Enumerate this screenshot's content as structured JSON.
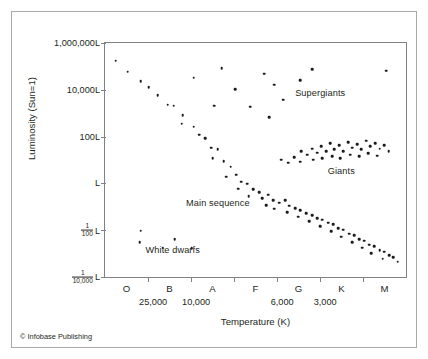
{
  "figure": {
    "credit": "© Infobase Publishing"
  },
  "chart_data": {
    "type": "scatter",
    "title": "",
    "xlabel": "Temperature (K)",
    "ylabel": "Luminosity (Sun=1)",
    "grid": false,
    "legend": "none",
    "x_axis": {
      "label": "Temperature (K)",
      "spectral_classes": [
        "O",
        "B",
        "A",
        "F",
        "G",
        "K",
        "M"
      ],
      "temperature_ticks": [
        {
          "label": "25,000",
          "class": "B"
        },
        {
          "label": "10,000",
          "class": "A"
        },
        {
          "label": "6,000",
          "class": "G"
        },
        {
          "label": "3,000",
          "class": "K"
        }
      ],
      "direction": "decreasing temperature to the right"
    },
    "y_axis": {
      "label": "Luminosity (Sun=1)",
      "scale": "log",
      "ticks": [
        {
          "label": "1,000,000L",
          "value": 1000000
        },
        {
          "label": "10,000L",
          "value": 10000
        },
        {
          "label": "100L",
          "value": 100
        },
        {
          "label": "L",
          "value": 1
        },
        {
          "label": "1/100 L",
          "numerator": "1",
          "denominator": "100",
          "unit": "L",
          "value": 0.01
        },
        {
          "label": "1/10,000 L",
          "numerator": "1",
          "denominator": "10,000",
          "unit": "L",
          "value": 0.0001
        }
      ],
      "ylim": [
        0.0001,
        1000000
      ]
    },
    "annotations": [
      {
        "text": "Supergiants",
        "x": 0.715,
        "y": 0.215
      },
      {
        "text": "Giants",
        "x": 0.785,
        "y": 0.545
      },
      {
        "text": "Main sequence",
        "x": 0.375,
        "y": 0.685
      },
      {
        "text": "White dwarfs",
        "x": 0.225,
        "y": 0.885
      }
    ],
    "series": [
      {
        "name": "Main sequence",
        "points": [
          [
            0.035,
            0.075
          ],
          [
            0.075,
            0.122
          ],
          [
            0.118,
            0.162
          ],
          [
            0.145,
            0.188
          ],
          [
            0.175,
            0.223
          ],
          [
            0.208,
            0.263
          ],
          [
            0.228,
            0.268
          ],
          [
            0.258,
            0.308
          ],
          [
            0.255,
            0.345
          ],
          [
            0.295,
            0.358
          ],
          [
            0.312,
            0.392
          ],
          [
            0.332,
            0.408
          ],
          [
            0.352,
            0.448
          ],
          [
            0.375,
            0.455
          ],
          [
            0.358,
            0.492
          ],
          [
            0.395,
            0.505
          ],
          [
            0.418,
            0.528
          ],
          [
            0.435,
            0.562
          ],
          [
            0.402,
            0.572
          ],
          [
            0.452,
            0.592
          ],
          [
            0.472,
            0.602
          ],
          [
            0.442,
            0.622
          ],
          [
            0.492,
            0.625
          ],
          [
            0.512,
            0.638
          ],
          [
            0.478,
            0.655
          ],
          [
            0.522,
            0.662
          ],
          [
            0.542,
            0.648
          ],
          [
            0.558,
            0.672
          ],
          [
            0.535,
            0.692
          ],
          [
            0.578,
            0.682
          ],
          [
            0.598,
            0.672
          ],
          [
            0.562,
            0.708
          ],
          [
            0.612,
            0.695
          ],
          [
            0.632,
            0.705
          ],
          [
            0.605,
            0.722
          ],
          [
            0.648,
            0.715
          ],
          [
            0.668,
            0.728
          ],
          [
            0.642,
            0.742
          ],
          [
            0.688,
            0.735
          ],
          [
            0.705,
            0.748
          ],
          [
            0.678,
            0.762
          ],
          [
            0.722,
            0.755
          ],
          [
            0.742,
            0.768
          ],
          [
            0.715,
            0.782
          ],
          [
            0.758,
            0.775
          ],
          [
            0.775,
            0.792
          ],
          [
            0.752,
            0.805
          ],
          [
            0.792,
            0.798
          ],
          [
            0.812,
            0.815
          ],
          [
            0.785,
            0.828
          ],
          [
            0.828,
            0.822
          ],
          [
            0.845,
            0.838
          ],
          [
            0.822,
            0.852
          ],
          [
            0.862,
            0.845
          ],
          [
            0.878,
            0.862
          ],
          [
            0.855,
            0.875
          ],
          [
            0.895,
            0.868
          ],
          [
            0.912,
            0.885
          ],
          [
            0.885,
            0.898
          ],
          [
            0.928,
            0.892
          ],
          [
            0.945,
            0.908
          ],
          [
            0.922,
            0.922
          ],
          [
            0.958,
            0.915
          ],
          [
            0.972,
            0.935
          ]
        ]
      },
      {
        "name": "Giants",
        "points": [
          [
            0.628,
            0.488
          ],
          [
            0.652,
            0.462
          ],
          [
            0.672,
            0.478
          ],
          [
            0.648,
            0.508
          ],
          [
            0.688,
            0.452
          ],
          [
            0.705,
            0.468
          ],
          [
            0.692,
            0.498
          ],
          [
            0.718,
            0.442
          ],
          [
            0.735,
            0.462
          ],
          [
            0.722,
            0.492
          ],
          [
            0.748,
            0.428
          ],
          [
            0.762,
            0.455
          ],
          [
            0.755,
            0.485
          ],
          [
            0.778,
            0.438
          ],
          [
            0.792,
            0.462
          ],
          [
            0.782,
            0.492
          ],
          [
            0.808,
            0.425
          ],
          [
            0.822,
            0.448
          ],
          [
            0.815,
            0.478
          ],
          [
            0.838,
            0.432
          ],
          [
            0.852,
            0.455
          ],
          [
            0.845,
            0.485
          ],
          [
            0.868,
            0.418
          ],
          [
            0.882,
            0.442
          ],
          [
            0.875,
            0.472
          ],
          [
            0.898,
            0.428
          ],
          [
            0.912,
            0.452
          ],
          [
            0.905,
            0.482
          ],
          [
            0.928,
            0.438
          ],
          [
            0.942,
            0.462
          ],
          [
            0.608,
            0.512
          ],
          [
            0.585,
            0.498
          ]
        ]
      },
      {
        "name": "Supergiants",
        "points": [
          [
            0.388,
            0.108
          ],
          [
            0.295,
            0.148
          ],
          [
            0.432,
            0.198
          ],
          [
            0.528,
            0.132
          ],
          [
            0.562,
            0.178
          ],
          [
            0.648,
            0.158
          ],
          [
            0.688,
            0.112
          ],
          [
            0.592,
            0.242
          ],
          [
            0.362,
            0.268
          ],
          [
            0.482,
            0.272
          ],
          [
            0.935,
            0.118
          ],
          [
            0.545,
            0.318
          ]
        ]
      },
      {
        "name": "White dwarfs",
        "points": [
          [
            0.118,
            0.802
          ],
          [
            0.115,
            0.852
          ],
          [
            0.192,
            0.875
          ],
          [
            0.232,
            0.838
          ],
          [
            0.288,
            0.878
          ]
        ]
      }
    ]
  }
}
